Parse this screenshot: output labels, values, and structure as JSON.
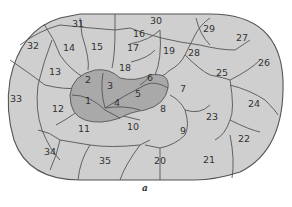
{
  "figure": {
    "caption": "a",
    "region_labels": [
      "1",
      "2",
      "3",
      "4",
      "5",
      "6",
      "7",
      "8",
      "9",
      "10",
      "11",
      "12",
      "13",
      "14",
      "15",
      "16",
      "17",
      "18",
      "19",
      "20",
      "21",
      "22",
      "23",
      "24",
      "25",
      "26",
      "27",
      "28",
      "29",
      "30",
      "31",
      "32",
      "33",
      "34",
      "35"
    ],
    "inner_regions": [
      "1",
      "2",
      "3",
      "4",
      "5",
      "6"
    ],
    "colors": {
      "outer_fill": "#cfcfcf",
      "inner_fill": "#a9a9a9",
      "stroke": "#555555"
    }
  }
}
